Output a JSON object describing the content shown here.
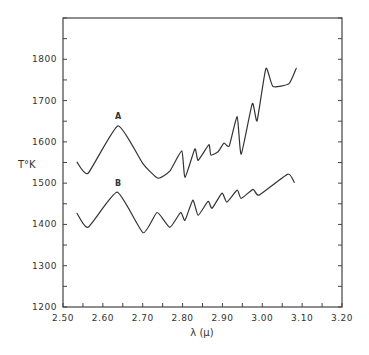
{
  "chart_data": {
    "type": "line",
    "title": "",
    "xlabel": "λ (μ)",
    "ylabel": "T°K",
    "xlim": [
      2.5,
      3.2
    ],
    "ylim": [
      1200,
      1900
    ],
    "x_ticks": [
      "2.50",
      "2.60",
      "2.70",
      "2.80",
      "2.90",
      "3.00",
      "3.10",
      "3.20"
    ],
    "x_tick_values": [
      2.5,
      2.6,
      2.7,
      2.8,
      2.9,
      3.0,
      3.1,
      3.2
    ],
    "x_minor_step": 0.05,
    "y_ticks": [
      "1200",
      "1300",
      "1400",
      "1500",
      "1600",
      "1700",
      "1800"
    ],
    "y_tick_values": [
      1200,
      1300,
      1400,
      1500,
      1600,
      1700,
      1800
    ],
    "y_minor_step": 50,
    "grid": false,
    "legend": "none",
    "series": [
      {
        "name": "A",
        "label_at": [
          2.638,
          1655
        ],
        "x": [
          2.535,
          2.563,
          2.638,
          2.7,
          2.738,
          2.768,
          2.798,
          2.806,
          2.831,
          2.839,
          2.866,
          2.871,
          2.889,
          2.904,
          2.917,
          2.937,
          2.947,
          2.975,
          2.987,
          3.009,
          3.027,
          3.067,
          3.085
        ],
        "y": [
          1551,
          1524,
          1639,
          1548,
          1512,
          1529,
          1578,
          1514,
          1583,
          1555,
          1593,
          1568,
          1576,
          1597,
          1590,
          1661,
          1570,
          1693,
          1651,
          1778,
          1734,
          1741,
          1778
        ]
      },
      {
        "name": "B",
        "label_at": [
          2.638,
          1494
        ],
        "x": [
          2.535,
          2.563,
          2.636,
          2.701,
          2.736,
          2.768,
          2.795,
          2.806,
          2.826,
          2.839,
          2.864,
          2.874,
          2.899,
          2.911,
          2.937,
          2.947,
          2.977,
          2.992,
          3.064,
          3.08
        ],
        "y": [
          1427,
          1393,
          1478,
          1380,
          1429,
          1393,
          1429,
          1410,
          1459,
          1422,
          1456,
          1439,
          1476,
          1454,
          1483,
          1463,
          1485,
          1471,
          1522,
          1502
        ]
      }
    ]
  }
}
